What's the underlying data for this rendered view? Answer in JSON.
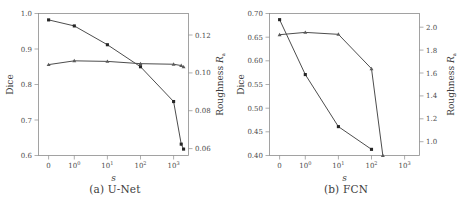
{
  "figure": {
    "panels": [
      {
        "id": "a",
        "caption": "(a)  U-Net",
        "caption_label": "(a)",
        "caption_name": "U-Net"
      },
      {
        "id": "b",
        "caption": "(b)  FCN",
        "caption_label": "(b)",
        "caption_name": "FCN"
      }
    ]
  },
  "chart_data": [
    {
      "type": "line",
      "panel": "a",
      "title": "(a) U-Net",
      "xlabel": "s",
      "ylabel": "Dice",
      "y2label": "Roughness R_a",
      "xscale": "symlog",
      "grid": false,
      "legend": "none",
      "x": [
        0,
        1,
        10,
        100,
        1000,
        2000
      ],
      "xtick_labels": [
        "0",
        "10^0",
        "10^1",
        "10^2",
        "10^3"
      ],
      "xtick_values": [
        0,
        1,
        10,
        100,
        1000
      ],
      "ylim": [
        0.6,
        1.0
      ],
      "ytick_labels": [
        "1.0",
        "0.9",
        "0.8",
        "0.7",
        "0.6"
      ],
      "ytick_values": [
        1.0,
        0.9,
        0.8,
        0.7,
        0.6
      ],
      "y2lim": [
        0.0535,
        0.1285
      ],
      "y2tick_labels": [
        "0.12",
        "0.10",
        "0.08",
        "0.06"
      ],
      "y2tick_values": [
        0.12,
        0.1,
        0.08,
        0.06
      ],
      "series": [
        {
          "name": "Dice",
          "axis": "left",
          "marker": "square",
          "values": [
            0.982,
            0.965,
            0.912,
            0.85,
            0.752,
            0.632,
            0.618
          ]
        },
        {
          "name": "Roughness R_a",
          "axis": "right",
          "marker": "triangle",
          "values": [
            0.1015,
            0.1035,
            0.1032,
            0.102,
            0.1017,
            0.101,
            0.1003
          ]
        }
      ],
      "x_points": [
        0,
        1,
        10,
        100,
        1000,
        1700,
        2000
      ]
    },
    {
      "type": "line",
      "panel": "b",
      "title": "(b) FCN",
      "xlabel": "s",
      "ylabel": "Dice",
      "y2label": "Roughness R_a",
      "xscale": "symlog",
      "grid": false,
      "legend": "none",
      "xtick_labels": [
        "0",
        "10^0",
        "10^1",
        "10^2",
        "10^3"
      ],
      "xtick_values": [
        0,
        1,
        10,
        100,
        1000
      ],
      "ylim": [
        0.4,
        0.7
      ],
      "ytick_labels": [
        "0.70",
        "0.65",
        "0.60",
        "0.55",
        "0.50",
        "0.45",
        "0.40"
      ],
      "ytick_values": [
        0.7,
        0.65,
        0.6,
        0.55,
        0.5,
        0.45,
        0.4
      ],
      "y2lim": [
        0.88,
        2.12
      ],
      "y2tick_labels": [
        "2.0",
        "1.8",
        "1.6",
        "1.4",
        "1.2",
        "1.0"
      ],
      "y2tick_values": [
        2.0,
        1.8,
        1.6,
        1.4,
        1.2,
        1.0
      ],
      "series": [
        {
          "name": "Dice",
          "axis": "left",
          "marker": "square",
          "values": [
            0.687,
            0.571,
            0.461,
            0.413
          ]
        },
        {
          "name": "Roughness R_a",
          "axis": "right",
          "marker": "triangle",
          "values": [
            1.935,
            1.955,
            1.938,
            1.638,
            0.88
          ]
        }
      ],
      "x_points_dice": [
        0,
        1,
        10,
        100
      ],
      "x_points_roughness": [
        0,
        1,
        10,
        100,
        220
      ]
    }
  ]
}
